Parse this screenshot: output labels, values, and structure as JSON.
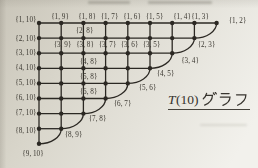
{
  "page": {
    "bg_base": "#d8d5ca",
    "bg_light": "#f2f1ec",
    "bg_dark": "#c9c5b9",
    "ink": "#2e2b26"
  },
  "title": {
    "full": "T(10) グラフ",
    "math_T": "T",
    "math_arg": "(10)",
    "suffix_jp": "グラフ"
  },
  "graph": {
    "kind": "triangular-graph-T10-vertex-grid",
    "origin_x": 39,
    "origin_y": 23,
    "dx": 22.2,
    "dy": 15.1,
    "row_node_counts": [
      9,
      8,
      7,
      6,
      5,
      4,
      3,
      2,
      1
    ],
    "node_radius": 2.2,
    "ink": "#2b2823",
    "edge_width": 1.3,
    "label_font_size": 7.2,
    "label_color": "#3b3831",
    "labels": [
      {
        "t": "{1, 10}",
        "x": 36.5,
        "y": 19.5,
        "a": "e"
      },
      {
        "t": "{2, 10}",
        "x": 36.5,
        "y": 39.2,
        "a": "e"
      },
      {
        "t": "{3, 10}",
        "x": 36.5,
        "y": 52.8,
        "a": "e"
      },
      {
        "t": "{4, 10}",
        "x": 36.5,
        "y": 67.8,
        "a": "e"
      },
      {
        "t": "{5, 10}",
        "x": 36.5,
        "y": 82.8,
        "a": "e"
      },
      {
        "t": "{6, 10}",
        "x": 36.5,
        "y": 97.8,
        "a": "e"
      },
      {
        "t": "{7, 10}",
        "x": 36.5,
        "y": 112.8,
        "a": "e"
      },
      {
        "t": "{8, 10}",
        "x": 36.5,
        "y": 131.2,
        "a": "e"
      },
      {
        "t": "{1, 9}",
        "x": 60,
        "y": 17,
        "a": "m"
      },
      {
        "t": "{1, 8}",
        "x": 87,
        "y": 17,
        "a": "m"
      },
      {
        "t": "{1, 7}",
        "x": 109.5,
        "y": 17,
        "a": "m"
      },
      {
        "t": "{1, 6}",
        "x": 132,
        "y": 17,
        "a": "m"
      },
      {
        "t": "{1, 5}",
        "x": 154.5,
        "y": 17,
        "a": "m"
      },
      {
        "t": "{1, 4}",
        "x": 182,
        "y": 17,
        "a": "m"
      },
      {
        "t": "{1, 3}",
        "x": 200,
        "y": 17,
        "a": "m"
      },
      {
        "t": "{1, 2}",
        "x": 237.5,
        "y": 20.5,
        "a": "m"
      },
      {
        "t": "{2, 3}",
        "x": 206.5,
        "y": 44.5,
        "a": "m"
      },
      {
        "t": "{3, 4}",
        "x": 190,
        "y": 61,
        "a": "m"
      },
      {
        "t": "{4, 5}",
        "x": 165.5,
        "y": 73.5,
        "a": "m"
      },
      {
        "t": "{5, 6}",
        "x": 147.5,
        "y": 88,
        "a": "m"
      },
      {
        "t": "{6, 7}",
        "x": 122.5,
        "y": 104,
        "a": "m"
      },
      {
        "t": "{7, 8}",
        "x": 97.5,
        "y": 118.5,
        "a": "m"
      },
      {
        "t": "{8, 9}",
        "x": 73.5,
        "y": 135,
        "a": "m"
      },
      {
        "t": "{9, 10}",
        "x": 33,
        "y": 153.5,
        "a": "m"
      },
      {
        "t": "{2, 8}",
        "x": 84.5,
        "y": 31,
        "a": "m"
      },
      {
        "t": "{3, 9}",
        "x": 62.5,
        "y": 44.5,
        "a": "m"
      },
      {
        "t": "{3, 8}",
        "x": 85,
        "y": 44.5,
        "a": "m"
      },
      {
        "t": "{3, 7}",
        "x": 107.5,
        "y": 44.5,
        "a": "m"
      },
      {
        "t": "{3, 6}",
        "x": 129.5,
        "y": 44.5,
        "a": "m"
      },
      {
        "t": "{3, 5}",
        "x": 151.5,
        "y": 44.5,
        "a": "m"
      },
      {
        "t": "{4, 8}",
        "x": 88.5,
        "y": 62,
        "a": "m"
      },
      {
        "t": "{5, 8}",
        "x": 88.5,
        "y": 77.3,
        "a": "m"
      },
      {
        "t": "{6, 8}",
        "x": 88.5,
        "y": 92.4,
        "a": "m"
      }
    ]
  },
  "artifacts": {
    "top_smudges": [
      {
        "x": 88,
        "y": 1,
        "w": 42,
        "h": 2.6
      },
      {
        "x": 148,
        "y": 1,
        "w": 64,
        "h": 2.6
      }
    ],
    "faint_streak": {
      "x": 200,
      "y": 123.5,
      "w": 47,
      "h": 2.4
    }
  }
}
